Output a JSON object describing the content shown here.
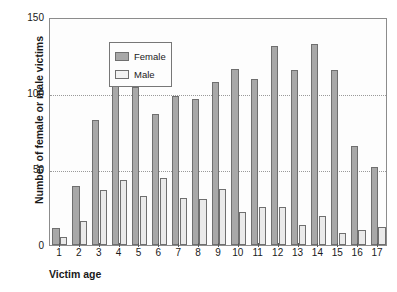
{
  "chart_data": {
    "type": "bar",
    "title": "",
    "xlabel": "Victim age",
    "ylabel": "Number of female or male victims",
    "categories": [
      "1",
      "2",
      "3",
      "4",
      "5",
      "6",
      "7",
      "8",
      "9",
      "10",
      "11",
      "12",
      "13",
      "14",
      "15",
      "16",
      "17"
    ],
    "series": [
      {
        "name": "Female",
        "color": "#a8a8a8",
        "values": [
          11,
          39,
          82,
          109,
          104,
          86,
          98,
          96,
          107,
          116,
          109,
          131,
          115,
          132,
          115,
          65,
          51
        ]
      },
      {
        "name": "Male",
        "color": "#eaeaea",
        "values": [
          5,
          16,
          36,
          43,
          32,
          44,
          31,
          30,
          37,
          22,
          25,
          25,
          13,
          19,
          8,
          10,
          12
        ]
      }
    ],
    "ylim": [
      0,
      150
    ],
    "yticks": [
      0,
      50,
      100,
      150
    ],
    "ytick_labels": [
      "0",
      "50",
      "100",
      "150"
    ],
    "gridlines_at": [
      50,
      100
    ],
    "grid": "horizontal-dotted",
    "legend_position": "top-left-inside",
    "legend_entries": [
      "Female",
      "Male"
    ]
  }
}
